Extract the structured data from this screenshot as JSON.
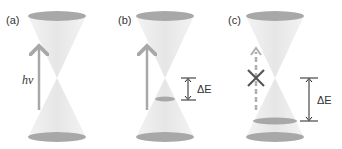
{
  "panels": [
    {
      "label": "(a)",
      "arrow_label": "hv"
    },
    {
      "label": "(b)",
      "delta_label": "ΔE"
    },
    {
      "label": "(c)",
      "delta_label": "ΔE"
    }
  ],
  "colors": {
    "cone_fill": "#f0f0f0",
    "ellipse_fill": "#a8a8a8",
    "arrow": "#a8a8a8",
    "line": "#222222",
    "cross": "#555555"
  }
}
